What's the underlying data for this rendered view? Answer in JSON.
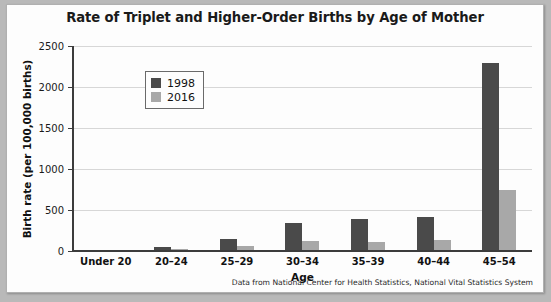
{
  "chart_data": {
    "type": "bar",
    "title": "Rate of Triplet and Higher-Order Births by Age of Mother",
    "xlabel": "Age",
    "ylabel": "Birth rate (per 100,000 births)",
    "categories": [
      "Under 20",
      "20–24",
      "25–29",
      "30–34",
      "35–39",
      "40–44",
      "45–54"
    ],
    "series": [
      {
        "name": "1998",
        "color": "#4a4a4a",
        "values": [
          5,
          45,
          150,
          345,
          395,
          420,
          2290
        ]
      },
      {
        "name": "2016",
        "color": "#a8a8a8",
        "values": [
          3,
          25,
          60,
          125,
          115,
          130,
          740
        ]
      }
    ],
    "ylim": [
      0,
      2500
    ],
    "yticks": [
      0,
      500,
      1000,
      1500,
      2000,
      2500
    ],
    "ytick_labels": [
      "0",
      "500",
      "1000",
      "1500",
      "2000",
      "2500"
    ],
    "grid": true,
    "legend_position": "upper left",
    "source_note": "Data from National Center for Health Statistics, National Vital Statistics System"
  }
}
